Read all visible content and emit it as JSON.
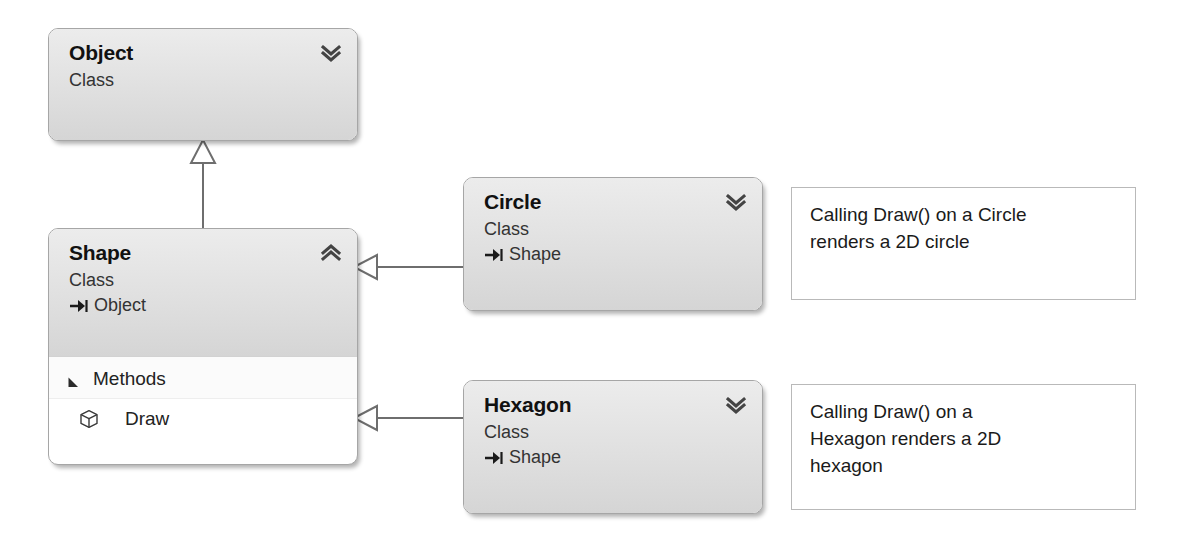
{
  "diagram": {
    "type": "uml-class-diagram",
    "colors": {
      "box_border": "#a6a6a6",
      "header_gradient_top": "#ececec",
      "header_gradient_bottom": "#d5d5d5",
      "body_background": "#ffffff",
      "note_border": "#b9b9b9",
      "connector_line": "#6e6e6e",
      "text": "#1a1a1a"
    }
  },
  "classes": [
    {
      "id": "object",
      "name": "Object",
      "stereotype": "Class",
      "base": null,
      "collapsed": true,
      "toggle_icon": "double-chevron-down-icon",
      "compartments": []
    },
    {
      "id": "shape",
      "name": "Shape",
      "stereotype": "Class",
      "base": "Object",
      "base_icon": "inheritance-arrow-icon",
      "collapsed": false,
      "toggle_icon": "double-chevron-up-icon",
      "compartments": [
        {
          "label": "Methods",
          "expanded": true,
          "caret_icon": "caret-expanded-icon",
          "members": [
            {
              "name": "Draw",
              "icon": "method-cube-icon"
            }
          ]
        }
      ]
    },
    {
      "id": "circle",
      "name": "Circle",
      "stereotype": "Class",
      "base": "Shape",
      "base_icon": "inheritance-arrow-icon",
      "collapsed": true,
      "toggle_icon": "double-chevron-down-icon",
      "compartments": []
    },
    {
      "id": "hexagon",
      "name": "Hexagon",
      "stereotype": "Class",
      "base": "Shape",
      "base_icon": "inheritance-arrow-icon",
      "collapsed": true,
      "toggle_icon": "double-chevron-down-icon",
      "compartments": []
    }
  ],
  "notes": [
    {
      "id": "note-circle",
      "lines": [
        "Calling Draw() on a Circle",
        "renders a 2D circle"
      ],
      "attached_to": "circle"
    },
    {
      "id": "note-hexagon",
      "lines": [
        "Calling Draw() on a",
        "Hexagon renders a 2D",
        "hexagon"
      ],
      "attached_to": "hexagon"
    }
  ],
  "connectors": [
    {
      "id": "shape-to-object",
      "from": "shape",
      "to": "object",
      "kind": "generalization",
      "arrowhead": "hollow-triangle"
    },
    {
      "id": "circle-to-shape",
      "from": "circle",
      "to": "shape",
      "kind": "generalization",
      "arrowhead": "hollow-triangle"
    },
    {
      "id": "hexagon-to-shape",
      "from": "hexagon",
      "to": "shape",
      "kind": "generalization",
      "arrowhead": "hollow-triangle"
    }
  ]
}
